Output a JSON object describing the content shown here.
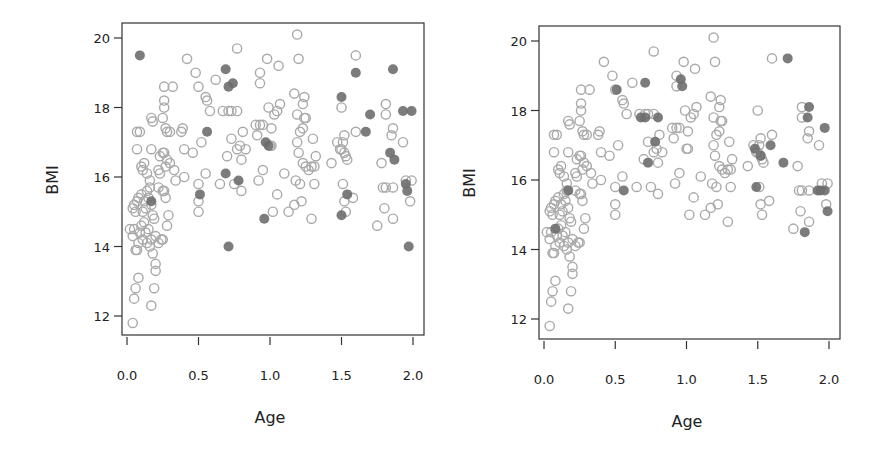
{
  "chart_data": [
    {
      "type": "scatter",
      "title": "",
      "xlabel": "Age",
      "ylabel": "BMI",
      "xlim": [
        0.0,
        2.0
      ],
      "ylim": [
        11.7,
        20.3
      ],
      "xticks": [
        "0.0",
        "0.5",
        "1.0",
        "1.5",
        "2.0"
      ],
      "yticks": [
        "12",
        "14",
        "16",
        "18",
        "20"
      ],
      "grid": false,
      "legend": null,
      "series": [
        {
          "name": "open",
          "marker": "open-circle",
          "color": "#a9a9a9",
          "points": [
            [
              0.04,
              11.8
            ],
            [
              0.05,
              12.5
            ],
            [
              0.06,
              12.8
            ],
            [
              0.08,
              13.1
            ],
            [
              0.17,
              12.3
            ],
            [
              0.19,
              12.8
            ],
            [
              0.18,
              13.8
            ],
            [
              0.2,
              13.5
            ],
            [
              0.2,
              13.3
            ],
            [
              0.02,
              14.5
            ],
            [
              0.04,
              14.3
            ],
            [
              0.05,
              14.5
            ],
            [
              0.06,
              13.9
            ],
            [
              0.07,
              13.9
            ],
            [
              0.08,
              14.1
            ],
            [
              0.09,
              14.4
            ],
            [
              0.1,
              14.6
            ],
            [
              0.11,
              14.2
            ],
            [
              0.12,
              14.7
            ],
            [
              0.13,
              14.4
            ],
            [
              0.14,
              14.1
            ],
            [
              0.15,
              14.5
            ],
            [
              0.16,
              14.0
            ],
            [
              0.17,
              14.2
            ],
            [
              0.18,
              14.9
            ],
            [
              0.2,
              14.3
            ],
            [
              0.22,
              14.1
            ],
            [
              0.24,
              14.2
            ],
            [
              0.25,
              14.2
            ],
            [
              0.04,
              15.1
            ],
            [
              0.05,
              15.2
            ],
            [
              0.06,
              15.0
            ],
            [
              0.07,
              15.3
            ],
            [
              0.08,
              15.4
            ],
            [
              0.1,
              15.5
            ],
            [
              0.11,
              15.0
            ],
            [
              0.12,
              15.3
            ],
            [
              0.13,
              15.1
            ],
            [
              0.14,
              15.6
            ],
            [
              0.15,
              15.4
            ],
            [
              0.16,
              15.7
            ],
            [
              0.17,
              15.2
            ],
            [
              0.19,
              14.8
            ],
            [
              0.22,
              15.7
            ],
            [
              0.23,
              16.1
            ],
            [
              0.25,
              15.6
            ],
            [
              0.26,
              15.6
            ],
            [
              0.27,
              15.4
            ],
            [
              0.28,
              14.6
            ],
            [
              0.29,
              14.9
            ],
            [
              0.07,
              16.8
            ],
            [
              0.1,
              16.3
            ],
            [
              0.11,
              16.2
            ],
            [
              0.12,
              16.4
            ],
            [
              0.14,
              16.1
            ],
            [
              0.16,
              15.9
            ],
            [
              0.17,
              16.8
            ],
            [
              0.22,
              16.2
            ],
            [
              0.23,
              16.6
            ],
            [
              0.25,
              16.7
            ],
            [
              0.26,
              16.7
            ],
            [
              0.27,
              16.3
            ],
            [
              0.28,
              16.5
            ],
            [
              0.3,
              16.4
            ],
            [
              0.33,
              16.2
            ],
            [
              0.34,
              15.9
            ],
            [
              0.4,
              16.8
            ],
            [
              0.4,
              16.0
            ],
            [
              0.46,
              16.7
            ],
            [
              0.07,
              17.3
            ],
            [
              0.09,
              17.3
            ],
            [
              0.17,
              17.7
            ],
            [
              0.18,
              17.6
            ],
            [
              0.25,
              17.7
            ],
            [
              0.26,
              18.0
            ],
            [
              0.26,
              18.2
            ],
            [
              0.27,
              17.4
            ],
            [
              0.28,
              17.3
            ],
            [
              0.3,
              17.3
            ],
            [
              0.38,
              17.3
            ],
            [
              0.39,
              17.4
            ],
            [
              0.26,
              18.6
            ],
            [
              0.32,
              18.6
            ],
            [
              0.42,
              19.4
            ],
            [
              0.5,
              15.0
            ],
            [
              0.5,
              15.3
            ],
            [
              0.5,
              15.8
            ],
            [
              0.52,
              17.0
            ],
            [
              0.55,
              16.1
            ],
            [
              0.5,
              18.6
            ],
            [
              0.48,
              19.0
            ],
            [
              0.55,
              18.3
            ],
            [
              0.56,
              18.2
            ],
            [
              0.58,
              17.9
            ],
            [
              0.62,
              18.8
            ],
            [
              0.65,
              15.8
            ],
            [
              0.7,
              16.6
            ],
            [
              0.73,
              17.1
            ],
            [
              0.75,
              15.8
            ],
            [
              0.8,
              15.6
            ],
            [
              0.77,
              16.8
            ],
            [
              0.79,
              16.9
            ],
            [
              0.8,
              16.5
            ],
            [
              0.83,
              16.8
            ],
            [
              0.81,
              17.3
            ],
            [
              0.67,
              17.9
            ],
            [
              0.71,
              17.9
            ],
            [
              0.73,
              17.9
            ],
            [
              0.77,
              17.9
            ],
            [
              0.77,
              19.7
            ],
            [
              0.92,
              15.9
            ],
            [
              0.95,
              16.2
            ],
            [
              0.91,
              17.2
            ],
            [
              0.9,
              17.5
            ],
            [
              0.93,
              17.5
            ],
            [
              0.95,
              17.5
            ],
            [
              1.01,
              17.4
            ],
            [
              0.99,
              18.0
            ],
            [
              1.03,
              17.8
            ],
            [
              1.05,
              17.9
            ],
            [
              1.07,
              18.1
            ],
            [
              0.93,
              18.7
            ],
            [
              0.93,
              19.0
            ],
            [
              0.98,
              19.4
            ],
            [
              1.06,
              19.2
            ],
            [
              1.0,
              16.9
            ],
            [
              1.01,
              16.9
            ],
            [
              1.02,
              15.0
            ],
            [
              1.05,
              15.5
            ],
            [
              1.1,
              16.1
            ],
            [
              1.13,
              15.0
            ],
            [
              1.17,
              15.2
            ],
            [
              1.18,
              15.9
            ],
            [
              1.21,
              15.8
            ],
            [
              1.2,
              16.7
            ],
            [
              1.19,
              17.0
            ],
            [
              1.21,
              17.3
            ],
            [
              1.23,
              17.4
            ],
            [
              1.24,
              17.7
            ],
            [
              1.25,
              17.7
            ],
            [
              1.19,
              17.8
            ],
            [
              1.17,
              18.4
            ],
            [
              1.24,
              18.3
            ],
            [
              1.23,
              18.1
            ],
            [
              1.2,
              19.4
            ],
            [
              1.19,
              20.1
            ],
            [
              1.22,
              15.3
            ],
            [
              1.23,
              16.4
            ],
            [
              1.25,
              16.3
            ],
            [
              1.27,
              16.2
            ],
            [
              1.29,
              14.8
            ],
            [
              1.31,
              15.8
            ],
            [
              1.29,
              16.3
            ],
            [
              1.31,
              16.3
            ],
            [
              1.32,
              16.6
            ],
            [
              1.3,
              17.1
            ],
            [
              1.43,
              16.4
            ],
            [
              1.47,
              17.0
            ],
            [
              1.49,
              16.8
            ],
            [
              1.5,
              16.8
            ],
            [
              1.51,
              17.0
            ],
            [
              1.52,
              16.7
            ],
            [
              1.53,
              16.6
            ],
            [
              1.54,
              16.5
            ],
            [
              1.5,
              18.0
            ],
            [
              1.52,
              17.2
            ],
            [
              1.51,
              15.8
            ],
            [
              1.52,
              15.3
            ],
            [
              1.53,
              15.0
            ],
            [
              1.58,
              15.4
            ],
            [
              1.6,
              17.3
            ],
            [
              1.6,
              19.5
            ],
            [
              1.75,
              14.6
            ],
            [
              1.8,
              15.1
            ],
            [
              1.81,
              15.7
            ],
            [
              1.79,
              15.7
            ],
            [
              1.86,
              15.7
            ],
            [
              1.86,
              14.8
            ],
            [
              1.78,
              16.4
            ],
            [
              1.81,
              17.8
            ],
            [
              1.81,
              18.1
            ],
            [
              1.85,
              17.2
            ],
            [
              1.86,
              17.4
            ],
            [
              1.93,
              17.0
            ],
            [
              1.98,
              15.3
            ],
            [
              1.99,
              15.9
            ],
            [
              1.95,
              15.9
            ]
          ]
        },
        {
          "name": "filled",
          "marker": "filled-circle",
          "color": "#6e6e6e",
          "points": [
            [
              0.09,
              19.5
            ],
            [
              0.17,
              15.3
            ],
            [
              0.51,
              15.5
            ],
            [
              0.56,
              17.3
            ],
            [
              0.69,
              19.1
            ],
            [
              0.71,
              18.6
            ],
            [
              0.74,
              18.7
            ],
            [
              0.69,
              16.1
            ],
            [
              0.71,
              14.0
            ],
            [
              0.78,
              15.9
            ],
            [
              0.96,
              14.8
            ],
            [
              0.97,
              17.0
            ],
            [
              0.99,
              16.9
            ],
            [
              1.5,
              18.3
            ],
            [
              1.5,
              14.9
            ],
            [
              1.54,
              15.5
            ],
            [
              1.6,
              19.0
            ],
            [
              1.7,
              17.8
            ],
            [
              1.67,
              17.3
            ],
            [
              1.86,
              19.1
            ],
            [
              1.84,
              16.7
            ],
            [
              1.87,
              16.5
            ],
            [
              1.93,
              17.9
            ],
            [
              1.99,
              17.9
            ],
            [
              1.95,
              15.8
            ],
            [
              1.96,
              15.6
            ],
            [
              1.97,
              14.0
            ]
          ]
        }
      ]
    },
    {
      "type": "scatter",
      "title": "",
      "xlabel": "Age",
      "ylabel": "BMI",
      "xlim": [
        0.0,
        2.0
      ],
      "ylim": [
        11.7,
        20.3
      ],
      "xticks": [
        "0.0",
        "0.5",
        "1.0",
        "1.5",
        "2.0"
      ],
      "yticks": [
        "12",
        "14",
        "16",
        "18",
        "20"
      ],
      "grid": false,
      "legend": null,
      "series": [
        {
          "name": "open",
          "marker": "open-circle",
          "color": "#a9a9a9",
          "points": "same-as-panel-1"
        },
        {
          "name": "filled",
          "marker": "filled-circle",
          "color": "#6e6e6e",
          "points": [
            [
              0.08,
              14.6
            ],
            [
              0.17,
              15.7
            ],
            [
              0.51,
              18.6
            ],
            [
              0.56,
              15.7
            ],
            [
              0.71,
              18.8
            ],
            [
              0.68,
              17.8
            ],
            [
              0.71,
              17.8
            ],
            [
              0.8,
              17.8
            ],
            [
              0.78,
              17.1
            ],
            [
              0.73,
              16.5
            ],
            [
              0.96,
              18.9
            ],
            [
              0.97,
              18.7
            ],
            [
              1.48,
              16.9
            ],
            [
              1.52,
              16.7
            ],
            [
              1.59,
              17.0
            ],
            [
              1.49,
              15.8
            ],
            [
              1.71,
              19.5
            ],
            [
              1.68,
              16.5
            ],
            [
              1.86,
              18.1
            ],
            [
              1.85,
              17.8
            ],
            [
              1.97,
              17.5
            ],
            [
              1.83,
              14.5
            ],
            [
              1.94,
              15.7
            ],
            [
              1.97,
              15.7
            ],
            [
              1.99,
              15.1
            ],
            [
              1.92,
              15.7
            ]
          ]
        }
      ]
    }
  ],
  "panels": [
    {
      "xlabel": "Age",
      "ylabel": "BMI",
      "xticks": [
        "0.0",
        "0.5",
        "1.0",
        "1.5",
        "2.0"
      ],
      "yticks": [
        "12",
        "14",
        "16",
        "18",
        "20"
      ]
    },
    {
      "xlabel": "Age",
      "ylabel": "BMI",
      "xticks": [
        "0.0",
        "0.5",
        "1.0",
        "1.5",
        "2.0"
      ],
      "yticks": [
        "12",
        "14",
        "16",
        "18",
        "20"
      ]
    }
  ]
}
